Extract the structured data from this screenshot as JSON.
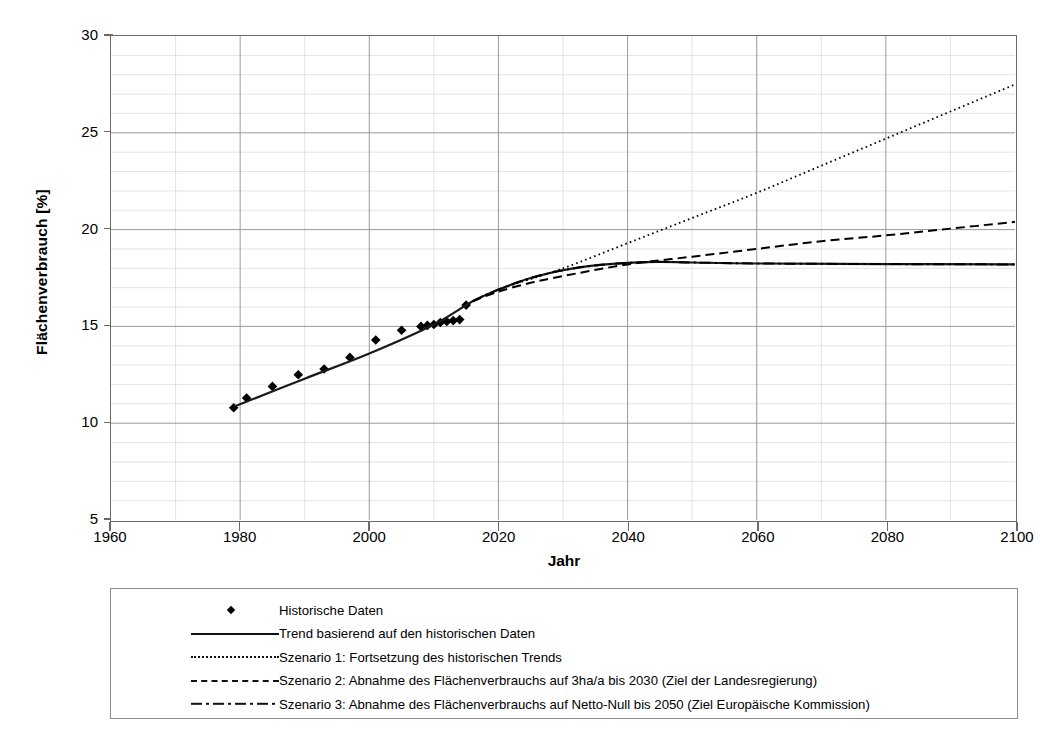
{
  "chart_data": {
    "type": "line",
    "title": "",
    "xlabel": "Jahr",
    "ylabel": "Flächenverbrauch [%]",
    "xlim": [
      1960,
      2100
    ],
    "ylim": [
      5,
      30
    ],
    "xticks": [
      1960,
      1980,
      2000,
      2020,
      2040,
      2060,
      2080,
      2100
    ],
    "yticks": [
      5,
      10,
      15,
      20,
      25,
      30
    ],
    "xtick_labels": [
      "1960",
      "1980",
      "2000",
      "2020",
      "2040",
      "2060",
      "2080",
      "2100"
    ],
    "ytick_labels": [
      "5",
      "10",
      "15",
      "20",
      "25",
      "30"
    ],
    "x_minor_step": 10,
    "y_minor_step": 1,
    "grid": true,
    "legend_position": "below-plot",
    "series": [
      {
        "name": "Historische Daten",
        "style": "markers",
        "marker": "diamond",
        "color": "#000000",
        "points": [
          [
            1979,
            10.8
          ],
          [
            1981,
            11.3
          ],
          [
            1985,
            11.9
          ],
          [
            1989,
            12.5
          ],
          [
            1993,
            12.8
          ],
          [
            1997,
            13.4
          ],
          [
            2001,
            14.3
          ],
          [
            2005,
            14.8
          ],
          [
            2008,
            15.0
          ],
          [
            2009,
            15.05
          ],
          [
            2010,
            15.1
          ],
          [
            2011,
            15.2
          ],
          [
            2012,
            15.25
          ],
          [
            2013,
            15.3
          ],
          [
            2014,
            15.35
          ],
          [
            2015,
            16.1
          ]
        ]
      },
      {
        "name": "Trend basierend auf den historischen Daten",
        "style": "solid",
        "color": "#1a1a1a",
        "points": [
          [
            1979,
            10.85
          ],
          [
            1990,
            12.3
          ],
          [
            2000,
            13.6
          ],
          [
            2010,
            15.1
          ],
          [
            2016,
            16.3
          ],
          [
            2020,
            16.9
          ],
          [
            2025,
            17.5
          ],
          [
            2030,
            17.9
          ],
          [
            2035,
            18.15
          ],
          [
            2040,
            18.28
          ],
          [
            2045,
            18.33
          ],
          [
            2050,
            18.3
          ],
          [
            2060,
            18.25
          ],
          [
            2080,
            18.22
          ],
          [
            2100,
            18.2
          ]
        ]
      },
      {
        "name": "Szenario 1: Fortsetzung des historischen Trends",
        "style": "dotted",
        "color": "#000000",
        "points": [
          [
            2016,
            16.3
          ],
          [
            2020,
            16.9
          ],
          [
            2030,
            18.0
          ],
          [
            2040,
            19.3
          ],
          [
            2050,
            20.6
          ],
          [
            2060,
            21.9
          ],
          [
            2070,
            23.3
          ],
          [
            2080,
            24.7
          ],
          [
            2090,
            26.1
          ],
          [
            2100,
            27.5
          ]
        ]
      },
      {
        "name": "Szenario 2: Abnahme des Flächenverbrauchs auf 3ha/a bis 2030 (Ziel der Landesregierung)",
        "style": "dashed",
        "color": "#000000",
        "points": [
          [
            2016,
            16.3
          ],
          [
            2020,
            16.8
          ],
          [
            2025,
            17.25
          ],
          [
            2030,
            17.6
          ],
          [
            2040,
            18.2
          ],
          [
            2050,
            18.6
          ],
          [
            2060,
            19.0
          ],
          [
            2070,
            19.4
          ],
          [
            2080,
            19.7
          ],
          [
            2090,
            20.05
          ],
          [
            2100,
            20.4
          ]
        ]
      },
      {
        "name": "Szenario 3: Abnahme des Flächenverbrauchs auf Netto-Null bis 2050 (Ziel Europäische Kommission)",
        "style": "dashdot",
        "color": "#000000",
        "points": [
          [
            2016,
            16.3
          ],
          [
            2020,
            16.9
          ],
          [
            2025,
            17.5
          ],
          [
            2030,
            17.9
          ],
          [
            2035,
            18.15
          ],
          [
            2040,
            18.28
          ],
          [
            2045,
            18.33
          ],
          [
            2050,
            18.3
          ],
          [
            2060,
            18.25
          ],
          [
            2080,
            18.22
          ],
          [
            2100,
            18.2
          ]
        ]
      }
    ]
  },
  "legend": {
    "entries": [
      {
        "label": "Historische Daten",
        "key": "diamond"
      },
      {
        "label": "Trend basierend auf den historischen Daten",
        "key": "solid"
      },
      {
        "label": "Szenario 1: Fortsetzung des historischen Trends",
        "key": "dotted"
      },
      {
        "label": "Szenario 2: Abnahme des Flächenverbrauchs auf 3ha/a bis 2030 (Ziel der Landesregierung)",
        "key": "dashed"
      },
      {
        "label": "Szenario 3: Abnahme des Flächenverbrauchs auf Netto-Null bis 2050 (Ziel Europäische Kommission)",
        "key": "dashdot"
      }
    ]
  },
  "colors": {
    "ink": "#000000",
    "frame": "#6a6a6a",
    "grid_major": "#9a9a9a",
    "grid_minor": "#dcdcdc",
    "legend_border": "#8d8d8d"
  }
}
